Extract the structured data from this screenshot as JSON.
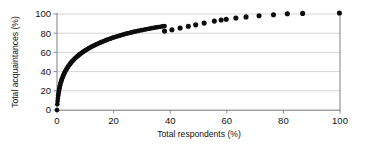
{
  "chart_data": {
    "type": "scatter",
    "title": "",
    "subtitle": "",
    "xlabel": "Total respondents (%)",
    "ylabel": "Total acquaintances (%)",
    "xlim": [
      0,
      100
    ],
    "ylim": [
      0,
      100
    ],
    "xticks": [
      0,
      20,
      40,
      60,
      80,
      100
    ],
    "yticks": [
      0,
      20,
      40,
      60,
      80,
      100
    ],
    "xticklabels": [
      "0",
      "20",
      "40",
      "60",
      "80",
      "100"
    ],
    "yticklabels": [
      "0",
      "20",
      "40",
      "60",
      "80",
      "100"
    ],
    "grid": "horizontal",
    "legend": "none",
    "marker": "filled-circle",
    "marker_color": "#0d0d0d",
    "gridline_color": "#c9c9c9",
    "axis_color": "#8a8a8a",
    "background_color": "#ffffff",
    "series": [
      {
        "name": "acquaintance accumulation",
        "points": [
          [
            0.0,
            0.0
          ],
          [
            0.3,
            6.0
          ],
          [
            0.6,
            9.5
          ],
          [
            0.9,
            12.5
          ],
          [
            1.2,
            15.0
          ],
          [
            1.5,
            17.2
          ],
          [
            1.8,
            19.2
          ],
          [
            2.1,
            21.0
          ],
          [
            2.4,
            22.7
          ],
          [
            2.7,
            24.3
          ],
          [
            3.0,
            25.8
          ],
          [
            3.4,
            27.4
          ],
          [
            3.8,
            28.9
          ],
          [
            4.2,
            30.3
          ],
          [
            4.6,
            31.6
          ],
          [
            5.0,
            32.8
          ],
          [
            5.5,
            34.2
          ],
          [
            6.0,
            35.5
          ],
          [
            6.5,
            36.7
          ],
          [
            7.0,
            37.9
          ],
          [
            7.5,
            39.0
          ],
          [
            8.0,
            40.1
          ],
          [
            8.6,
            41.3
          ],
          [
            9.2,
            42.4
          ],
          [
            9.8,
            43.5
          ],
          [
            10.4,
            44.5
          ],
          [
            11.0,
            45.5
          ],
          [
            11.7,
            46.5
          ],
          [
            12.4,
            47.5
          ],
          [
            13.1,
            48.5
          ],
          [
            13.8,
            49.4
          ],
          [
            14.5,
            50.3
          ],
          [
            15.3,
            51.2
          ],
          [
            16.1,
            52.1
          ],
          [
            16.9,
            53.0
          ],
          [
            17.7,
            53.8
          ],
          [
            18.5,
            54.6
          ],
          [
            19.4,
            55.5
          ],
          [
            20.3,
            56.3
          ],
          [
            21.2,
            57.1
          ],
          [
            22.1,
            57.9
          ],
          [
            23.0,
            58.6
          ],
          [
            24.0,
            59.4
          ],
          [
            25.0,
            60.2
          ],
          [
            26.0,
            60.9
          ],
          [
            27.0,
            61.6
          ],
          [
            28.0,
            62.3
          ],
          [
            29.1,
            63.0
          ],
          [
            30.2,
            63.7
          ],
          [
            31.3,
            64.4
          ],
          [
            32.4,
            65.0
          ],
          [
            33.5,
            65.7
          ],
          [
            34.7,
            66.4
          ],
          [
            35.9,
            67.0
          ],
          [
            37.1,
            67.7
          ],
          [
            38.3,
            68.3
          ],
          [
            39.5,
            68.9
          ],
          [
            40.8,
            69.5
          ],
          [
            42.1,
            70.1
          ],
          [
            43.4,
            70.7
          ],
          [
            44.7,
            71.3
          ],
          [
            46.0,
            71.9
          ],
          [
            47.4,
            72.5
          ],
          [
            48.8,
            73.1
          ],
          [
            50.2,
            73.6
          ],
          [
            51.6,
            74.2
          ],
          [
            53.0,
            74.7
          ],
          [
            54.5,
            75.3
          ],
          [
            56.0,
            75.8
          ],
          [
            57.5,
            76.3
          ],
          [
            59.0,
            76.8
          ],
          [
            60.6,
            77.3
          ],
          [
            62.2,
            77.8
          ],
          [
            63.8,
            78.3
          ],
          [
            65.4,
            78.8
          ],
          [
            67.0,
            79.3
          ],
          [
            68.7,
            79.8
          ],
          [
            70.4,
            80.2
          ],
          [
            72.1,
            80.7
          ],
          [
            73.8,
            81.1
          ],
          [
            75.6,
            81.6
          ],
          [
            77.4,
            82.0
          ],
          [
            79.2,
            82.4
          ],
          [
            81.0,
            82.8
          ],
          [
            82.9,
            83.2
          ],
          [
            84.8,
            83.6
          ],
          [
            86.7,
            84.0
          ],
          [
            88.6,
            84.4
          ],
          [
            90.6,
            84.8
          ],
          [
            92.6,
            85.2
          ],
          [
            94.6,
            85.6
          ],
          [
            96.6,
            86.0
          ],
          [
            98.7,
            86.4
          ],
          [
            100.8,
            86.7
          ],
          [
            102.9,
            87.1
          ],
          [
            105.0,
            87.4
          ]
        ],
        "sparse_points": [
          [
            38.0,
            82.2
          ],
          [
            40.6,
            83.6
          ],
          [
            43.5,
            85.4
          ],
          [
            46.4,
            87.3
          ],
          [
            49.0,
            88.7
          ],
          [
            52.0,
            90.5
          ],
          [
            55.6,
            92.6
          ],
          [
            58.0,
            93.8
          ],
          [
            59.8,
            94.6
          ],
          [
            63.2,
            95.8
          ],
          [
            66.8,
            97.0
          ],
          [
            71.4,
            98.2
          ],
          [
            76.5,
            99.2
          ],
          [
            81.4,
            100.2
          ],
          [
            86.8,
            100.6
          ],
          [
            99.8,
            101.0
          ]
        ]
      }
    ]
  },
  "figure": {
    "plot_left_px": 57,
    "plot_right_px": 340,
    "plot_top_px": 14,
    "plot_bottom_px": 110
  }
}
